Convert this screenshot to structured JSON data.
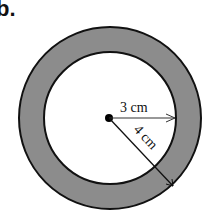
{
  "problem": {
    "label": "b."
  },
  "diagram": {
    "type": "annulus",
    "fill_color": "#8c8c8c",
    "stroke_color": "#111111",
    "background": "#ffffff",
    "inner_radius": {
      "value": 3,
      "unit": "cm",
      "text": "3 cm"
    },
    "outer_radius": {
      "value": 4,
      "unit": "cm",
      "text": "4 cm"
    },
    "shaded_region": "ring between inner and outer circles"
  }
}
